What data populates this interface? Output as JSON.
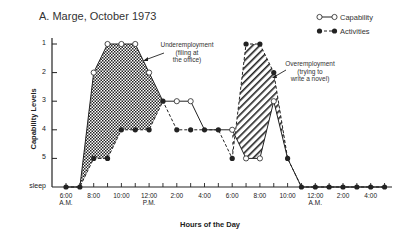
{
  "title": "A. Marge, October 1973",
  "legend": {
    "capability": "Capability",
    "activities": "Activities"
  },
  "axes": {
    "ylabel": "Capability Levels",
    "xlabel": "Hours of the Day",
    "yticks": [
      "1",
      "2",
      "3",
      "4",
      "5",
      "sleep"
    ],
    "xticks": [
      {
        "label": "6:00",
        "sub": "A.M.",
        "hour": 6
      },
      {
        "label": "8:00",
        "sub": "",
        "hour": 8
      },
      {
        "label": "10:00",
        "sub": "",
        "hour": 10
      },
      {
        "label": "12:00",
        "sub": "P.M.",
        "hour": 12
      },
      {
        "label": "2:00",
        "sub": "",
        "hour": 14
      },
      {
        "label": "4:00",
        "sub": "",
        "hour": 16
      },
      {
        "label": "6:00",
        "sub": "",
        "hour": 18
      },
      {
        "label": "8:00",
        "sub": "",
        "hour": 20
      },
      {
        "label": "10:00",
        "sub": "",
        "hour": 22
      },
      {
        "label": "12:00",
        "sub": "A.M.",
        "hour": 24
      },
      {
        "label": "2:00",
        "sub": "",
        "hour": 26
      },
      {
        "label": "4:00",
        "sub": "",
        "hour": 28
      }
    ]
  },
  "annotations": {
    "under": [
      "Underemployment",
      "(filing at",
      "the office)"
    ],
    "over": [
      "Overemployment",
      "(trying to",
      "write a novel)"
    ]
  },
  "chart_data": {
    "type": "line",
    "title": "A. Marge, October 1973",
    "xlabel": "Hours of the Day",
    "ylabel": "Capability Levels",
    "x": [
      "6AM",
      "7AM",
      "8AM",
      "9AM",
      "10AM",
      "11AM",
      "12PM",
      "1PM",
      "2PM",
      "3PM",
      "4PM",
      "5PM",
      "6PM",
      "7PM",
      "8PM",
      "9PM",
      "10PM",
      "11PM",
      "12AM",
      "1AM",
      "2AM",
      "3AM",
      "4AM",
      "5AM"
    ],
    "y_levels": [
      "1",
      "2",
      "3",
      "4",
      "5",
      "sleep"
    ],
    "y_note": "level 6 = sleep; lower number = higher capability (axis inverted)",
    "series": [
      {
        "name": "Capability",
        "style": "open-circle solid",
        "values": [
          6,
          6,
          2,
          1,
          1,
          1,
          2,
          3,
          3,
          3,
          4,
          4,
          4,
          5,
          5,
          3,
          5,
          6,
          6,
          6,
          6,
          6,
          6,
          6
        ]
      },
      {
        "name": "Activities",
        "style": "filled-circle dashed",
        "values": [
          6,
          6,
          5,
          5,
          4,
          4,
          4,
          3,
          4,
          4,
          4,
          4,
          5,
          1,
          1,
          2,
          5,
          6,
          6,
          6,
          6,
          6,
          6,
          6
        ]
      }
    ],
    "regions": [
      {
        "label": "Underemployment (filing at the office)",
        "from": "7AM",
        "to": "1PM",
        "fill": "crosshatch"
      },
      {
        "label": "Overemployment (trying to write a novel)",
        "from": "6PM",
        "to": "11PM",
        "fill": "diagonal-hatch"
      }
    ],
    "grid": false,
    "legend_position": "top-right"
  }
}
